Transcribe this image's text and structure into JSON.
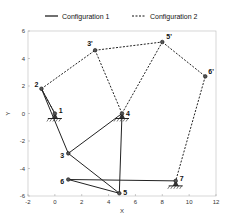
{
  "legend": {
    "config1": "Configuration 1",
    "config2": "Configuration 2"
  },
  "chart_data": {
    "type": "line",
    "title": "",
    "xlabel": "X",
    "ylabel": "Y",
    "xlim": [
      -2,
      12
    ],
    "ylim": [
      -6,
      6
    ],
    "xticks": [
      -2,
      0,
      2,
      4,
      6,
      8,
      10,
      12
    ],
    "yticks": [
      -6,
      -4,
      -2,
      0,
      2,
      4,
      6
    ],
    "legend_position": "top",
    "points": {
      "1": [
        0,
        0
      ],
      "2": [
        -1,
        1.8
      ],
      "3": [
        1,
        -2.9
      ],
      "4": [
        5,
        0
      ],
      "5": [
        4.8,
        -5.8
      ],
      "6": [
        1,
        -4.8
      ],
      "7": [
        9,
        -4.9
      ],
      "3'": [
        3,
        4.6
      ],
      "5'": [
        8,
        5.2
      ],
      "6'": [
        11.2,
        2.7
      ]
    },
    "series": [
      {
        "name": "Configuration 1",
        "style": "solid",
        "segments": [
          [
            "1",
            "2"
          ],
          [
            "2",
            "3"
          ],
          [
            "3",
            "4"
          ],
          [
            "3",
            "5"
          ],
          [
            "4",
            "5"
          ],
          [
            "6",
            "5"
          ],
          [
            "6",
            "7"
          ]
        ]
      },
      {
        "name": "Configuration 2",
        "style": "dashed",
        "segments": [
          [
            "1",
            "2"
          ],
          [
            "2",
            "3'"
          ],
          [
            "3'",
            "4"
          ],
          [
            "3'",
            "5'"
          ],
          [
            "4",
            "5'"
          ],
          [
            "5'",
            "6'"
          ],
          [
            "6'",
            "7"
          ]
        ]
      }
    ],
    "grounded_joints": [
      "1",
      "4",
      "7"
    ]
  }
}
